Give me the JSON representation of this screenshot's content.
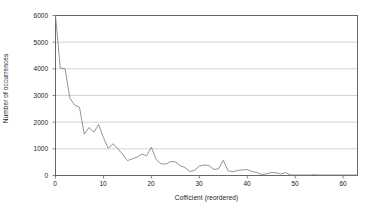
{
  "chart_data": {
    "type": "line",
    "title": "",
    "xlabel": "Cofficient (reordered)",
    "ylabel": "Number of occurrences",
    "xlim": [
      0,
      63
    ],
    "ylim": [
      0,
      6000
    ],
    "xticks": [
      0,
      10,
      20,
      30,
      40,
      50,
      60
    ],
    "yticks": [
      0,
      1000,
      2000,
      3000,
      4000,
      5000,
      6000
    ],
    "grid": "horizontal",
    "legend": "none",
    "line_color": "#888888",
    "series": [
      {
        "name": "occurrences",
        "x": [
          0,
          1,
          2,
          3,
          4,
          5,
          6,
          7,
          8,
          9,
          10,
          11,
          12,
          13,
          14,
          15,
          16,
          17,
          18,
          19,
          20,
          21,
          22,
          23,
          24,
          25,
          26,
          27,
          28,
          29,
          30,
          31,
          32,
          33,
          34,
          35,
          36,
          37,
          38,
          39,
          40,
          41,
          42,
          43,
          44,
          45,
          46,
          47,
          48,
          49,
          50,
          51,
          52,
          53,
          54,
          55,
          56,
          57,
          58,
          59,
          60,
          61,
          62,
          63
        ],
        "values": [
          6000,
          4030,
          4000,
          2900,
          2640,
          2560,
          1550,
          1800,
          1620,
          1910,
          1420,
          1020,
          1190,
          1010,
          790,
          560,
          620,
          690,
          800,
          740,
          1060,
          600,
          440,
          430,
          520,
          510,
          370,
          300,
          150,
          190,
          350,
          400,
          370,
          230,
          250,
          570,
          180,
          140,
          190,
          210,
          220,
          150,
          110,
          40,
          60,
          110,
          100,
          60,
          110,
          20,
          20,
          20,
          20,
          20,
          30,
          20,
          20,
          20,
          20,
          20,
          20,
          20,
          20,
          20
        ]
      }
    ]
  },
  "axes": {
    "y_tick_labels": [
      "0",
      "1000",
      "2000",
      "3000",
      "4000",
      "5000",
      "6000"
    ],
    "x_tick_labels": [
      "0",
      "10",
      "20",
      "30",
      "40",
      "50",
      "60"
    ]
  }
}
